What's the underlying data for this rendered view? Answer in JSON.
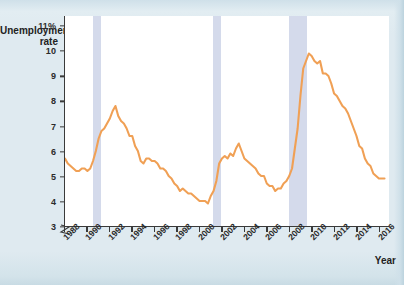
{
  "chart_data": {
    "type": "line",
    "title": "",
    "ylabel": "Unemployment rate",
    "xlabel": "Year",
    "ylim": [
      3,
      11.4
    ],
    "xlim": [
      1988,
      2016.9
    ],
    "grid": false,
    "legend": "none",
    "axis_break": true,
    "y_ticks": [
      {
        "value": 11,
        "label": "11%"
      },
      {
        "value": 10,
        "label": "10"
      },
      {
        "value": 9,
        "label": "9"
      },
      {
        "value": 8,
        "label": "8"
      },
      {
        "value": 7,
        "label": "7"
      },
      {
        "value": 6,
        "label": "6"
      },
      {
        "value": 5,
        "label": "5"
      },
      {
        "value": 4,
        "label": "4"
      },
      {
        "value": 3,
        "label": "3"
      }
    ],
    "x_ticks": [
      {
        "value": 1988,
        "label": "1988"
      },
      {
        "value": 1990,
        "label": "1990"
      },
      {
        "value": 1992,
        "label": "1992"
      },
      {
        "value": 1994,
        "label": "1994"
      },
      {
        "value": 1996,
        "label": "1996"
      },
      {
        "value": 1998,
        "label": "1998"
      },
      {
        "value": 2000,
        "label": "2000"
      },
      {
        "value": 2002,
        "label": "2002"
      },
      {
        "value": 2004,
        "label": "2004"
      },
      {
        "value": 2006,
        "label": "2006"
      },
      {
        "value": 2008,
        "label": "2008"
      },
      {
        "value": 2010,
        "label": "2010"
      },
      {
        "value": 2012,
        "label": "2012"
      },
      {
        "value": 2014,
        "label": "2014"
      },
      {
        "value": 2016,
        "label": "2016"
      }
    ],
    "recessions": [
      {
        "name": "recession-1990",
        "start": 1990.5,
        "end": 1991.2
      },
      {
        "name": "recession-2001",
        "start": 2001.2,
        "end": 2001.9
      },
      {
        "name": "recession-2008",
        "start": 2007.9,
        "end": 2009.5
      }
    ],
    "series": [
      {
        "name": "Unemployment rate",
        "color": "#F0A055",
        "x": [
          1988.0,
          1988.25,
          1988.5,
          1988.75,
          1989.0,
          1989.25,
          1989.5,
          1989.75,
          1990.0,
          1990.25,
          1990.5,
          1990.75,
          1991.0,
          1991.25,
          1991.5,
          1991.75,
          1992.0,
          1992.25,
          1992.5,
          1992.75,
          1993.0,
          1993.25,
          1993.5,
          1993.75,
          1994.0,
          1994.25,
          1994.5,
          1994.75,
          1995.0,
          1995.25,
          1995.5,
          1995.75,
          1996.0,
          1996.25,
          1996.5,
          1996.75,
          1997.0,
          1997.25,
          1997.5,
          1997.75,
          1998.0,
          1998.25,
          1998.5,
          1998.75,
          1999.0,
          1999.25,
          1999.5,
          1999.75,
          2000.0,
          2000.25,
          2000.5,
          2000.75,
          2001.0,
          2001.25,
          2001.5,
          2001.75,
          2002.0,
          2002.25,
          2002.5,
          2002.75,
          2003.0,
          2003.25,
          2003.5,
          2003.75,
          2004.0,
          2004.25,
          2004.5,
          2004.75,
          2005.0,
          2005.25,
          2005.5,
          2005.75,
          2006.0,
          2006.25,
          2006.5,
          2006.75,
          2007.0,
          2007.25,
          2007.5,
          2007.75,
          2008.0,
          2008.25,
          2008.5,
          2008.75,
          2009.0,
          2009.25,
          2009.5,
          2009.75,
          2010.0,
          2010.25,
          2010.5,
          2010.75,
          2011.0,
          2011.25,
          2011.5,
          2011.75,
          2012.0,
          2012.25,
          2012.5,
          2012.75,
          2013.0,
          2013.25,
          2013.5,
          2013.75,
          2014.0,
          2014.25,
          2014.5,
          2014.75,
          2015.0,
          2015.25,
          2015.5,
          2015.75,
          2016.0,
          2016.25,
          2016.5
        ],
        "y": [
          5.7,
          5.5,
          5.4,
          5.3,
          5.2,
          5.2,
          5.3,
          5.3,
          5.2,
          5.3,
          5.6,
          6.0,
          6.5,
          6.8,
          6.9,
          7.1,
          7.3,
          7.6,
          7.8,
          7.4,
          7.2,
          7.1,
          6.9,
          6.6,
          6.6,
          6.2,
          6.0,
          5.6,
          5.5,
          5.7,
          5.7,
          5.6,
          5.6,
          5.5,
          5.3,
          5.3,
          5.2,
          5.0,
          4.9,
          4.7,
          4.6,
          4.4,
          4.5,
          4.4,
          4.3,
          4.3,
          4.2,
          4.1,
          4.0,
          4.0,
          4.0,
          3.9,
          4.2,
          4.4,
          4.8,
          5.5,
          5.7,
          5.8,
          5.7,
          5.9,
          5.8,
          6.1,
          6.3,
          6.0,
          5.7,
          5.6,
          5.5,
          5.4,
          5.3,
          5.1,
          5.0,
          5.0,
          4.7,
          4.6,
          4.6,
          4.4,
          4.5,
          4.5,
          4.7,
          4.8,
          5.0,
          5.3,
          6.1,
          6.9,
          8.2,
          9.3,
          9.6,
          9.9,
          9.8,
          9.6,
          9.5,
          9.6,
          9.1,
          9.1,
          9.0,
          8.7,
          8.3,
          8.2,
          8.0,
          7.8,
          7.7,
          7.5,
          7.2,
          6.9,
          6.6,
          6.2,
          6.1,
          5.7,
          5.5,
          5.4,
          5.1,
          5.0,
          4.9,
          4.9,
          4.9
        ]
      }
    ]
  },
  "colors": {
    "line": "#F0A055",
    "recession_band": "#ccd4e8",
    "axis": "#3a3a3a",
    "page_background": "#dfeaf0",
    "plot_background": "#ffffff"
  }
}
